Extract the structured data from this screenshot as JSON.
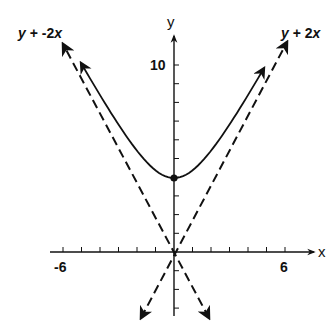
{
  "chart_data": {
    "type": "line",
    "title": "",
    "xlabel": "x",
    "ylabel": "y",
    "x_tick_labels": [
      {
        "value": -6,
        "label": "-6"
      },
      {
        "value": 6,
        "label": "6"
      }
    ],
    "y_tick_labels": [
      {
        "value": 10,
        "label": "10"
      }
    ],
    "x_ticks": [
      -6,
      -5,
      -4,
      -3,
      -2,
      -1,
      1,
      2,
      3,
      4,
      5,
      6
    ],
    "y_ticks": [
      -3,
      -2,
      -1,
      1,
      2,
      3,
      4,
      5,
      6,
      7,
      8,
      9,
      10
    ],
    "xlim": [
      -7.5,
      7.5
    ],
    "ylim": [
      -3.5,
      12
    ],
    "grid": false,
    "series": [
      {
        "name": "hyperbola (upper branch)",
        "style": "solid",
        "equation_hint": "vertex at (0, 4), asymptotes y = ±2x",
        "points": [
          {
            "x": -5,
            "y": 10.8
          },
          {
            "x": -4,
            "y": 8.9
          },
          {
            "x": -3,
            "y": 7.2
          },
          {
            "x": -2,
            "y": 5.7
          },
          {
            "x": -1,
            "y": 4.5
          },
          {
            "x": 0,
            "y": 4
          },
          {
            "x": 1,
            "y": 4.5
          },
          {
            "x": 2,
            "y": 5.7
          },
          {
            "x": 3,
            "y": 7.2
          },
          {
            "x": 4,
            "y": 8.9
          },
          {
            "x": 5,
            "y": 10.8
          }
        ],
        "marked_point": {
          "x": 0,
          "y": 4
        }
      },
      {
        "name": "y = -2x",
        "style": "dashed",
        "label": "y + -2x",
        "points": [
          {
            "x": 1.7,
            "y": -3.4
          },
          {
            "x": -6,
            "y": 11.2
          }
        ]
      },
      {
        "name": "y = 2x",
        "style": "dashed",
        "label": "y + 2x",
        "points": [
          {
            "x": -1.7,
            "y": -3.4
          },
          {
            "x": 6,
            "y": 11.8
          }
        ]
      }
    ],
    "annotations": [
      {
        "text": "y + -2x",
        "position": "top-left"
      },
      {
        "text": "y + 2x",
        "position": "top-right"
      }
    ],
    "legend": null
  },
  "labels": {
    "x_axis": "x",
    "y_axis": "y",
    "x_neg": "-6",
    "x_pos": "6",
    "y_ten": "10",
    "asym_left_y": "y",
    "asym_left_rest": " + -2",
    "asym_left_x": "x",
    "asym_right_y": "y",
    "asym_right_rest": " + 2",
    "asym_right_x": "x"
  },
  "colors": {
    "ink": "#111111",
    "background": "#ffffff"
  }
}
